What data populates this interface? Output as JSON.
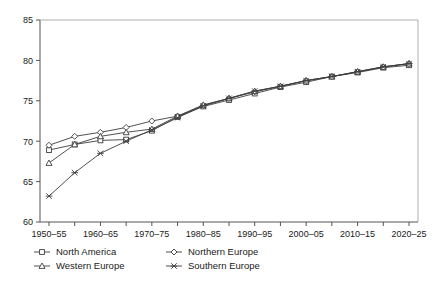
{
  "chart_data": {
    "type": "line",
    "title": "",
    "subtitle": "",
    "xlabel": "",
    "ylabel": "",
    "ylim": [
      60,
      85
    ],
    "yticks": [
      60,
      65,
      70,
      75,
      80,
      85
    ],
    "grid": false,
    "legend_position": "bottom-left",
    "categories": [
      "1950–55",
      "1955–60",
      "1960–65",
      "1965–70",
      "1970–75",
      "1975–80",
      "1980–85",
      "1985–90",
      "1990–95",
      "1995–2000",
      "2000–05",
      "2005–10",
      "2010–15",
      "2015–20",
      "2020–25"
    ],
    "xtick_labels_shown": [
      "1950–55",
      "",
      "1960–65",
      "",
      "1970–75",
      "",
      "1980–85",
      "",
      "1990–95",
      "",
      "2000–05",
      "",
      "2010–15",
      "",
      "2020–25"
    ],
    "series": [
      {
        "name": "North America",
        "marker": "square",
        "color": "#3d3d3d",
        "values": [
          68.9,
          69.6,
          70.1,
          70.2,
          71.3,
          73.0,
          74.3,
          75.1,
          75.9,
          76.7,
          77.3,
          78.0,
          78.5,
          79.1,
          79.4
        ]
      },
      {
        "name": "Northern Europe",
        "marker": "diamond",
        "color": "#3d3d3d",
        "values": [
          69.5,
          70.6,
          71.1,
          71.7,
          72.5,
          73.1,
          74.4,
          75.3,
          76.1,
          76.8,
          77.5,
          78.0,
          78.6,
          79.2,
          79.6
        ]
      },
      {
        "name": "Western Europe",
        "marker": "triangle",
        "color": "#3d3d3d",
        "values": [
          67.3,
          69.6,
          70.6,
          71.1,
          71.5,
          73.1,
          74.5,
          75.3,
          76.2,
          76.8,
          77.5,
          78.0,
          78.6,
          79.2,
          79.6
        ]
      },
      {
        "name": "Southern Europe",
        "marker": "star",
        "color": "#3d3d3d",
        "values": [
          63.2,
          66.1,
          68.5,
          70.0,
          71.4,
          72.9,
          74.4,
          75.3,
          76.2,
          76.8,
          77.5,
          78.0,
          78.6,
          79.2,
          79.6
        ]
      }
    ]
  },
  "legend": {
    "items": [
      {
        "label": "North America",
        "marker": "square-marker"
      },
      {
        "label": "Northern Europe",
        "marker": "diamond-marker"
      },
      {
        "label": "Western Europe",
        "marker": "triangle-marker"
      },
      {
        "label": "Southern Europe",
        "marker": "star-marker"
      }
    ]
  },
  "axes": {
    "y_tick_0": "60",
    "y_tick_1": "65",
    "y_tick_2": "70",
    "y_tick_3": "75",
    "y_tick_4": "80",
    "y_tick_5": "85"
  }
}
